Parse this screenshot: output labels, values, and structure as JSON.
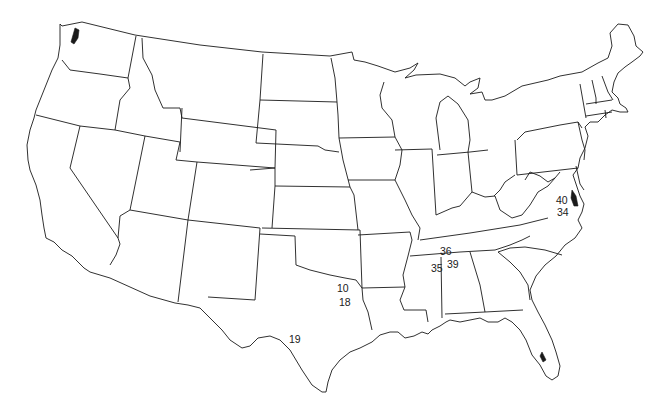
{
  "map": {
    "title": "",
    "region": "Contiguous United States",
    "style": "black outline state boundaries on white",
    "line_color": "#1a1a1a",
    "background_color": "#ffffff",
    "labels": [
      {
        "text": "10",
        "state": "Texas",
        "x": 337,
        "y": 292
      },
      {
        "text": "18",
        "state": "Texas",
        "x": 339,
        "y": 306
      },
      {
        "text": "19",
        "state": "Texas",
        "x": 289,
        "y": 343
      },
      {
        "text": "36",
        "state": "Kentucky",
        "x": 440,
        "y": 255
      },
      {
        "text": "35",
        "state": "Tennessee",
        "x": 431,
        "y": 272
      },
      {
        "text": "39",
        "state": "Tennessee",
        "x": 447,
        "y": 268
      },
      {
        "text": "40",
        "state": "Virginia",
        "x": 556,
        "y": 204
      },
      {
        "text": "34",
        "state": "Virginia",
        "x": 557,
        "y": 216
      }
    ]
  }
}
